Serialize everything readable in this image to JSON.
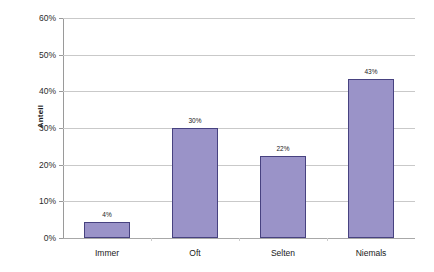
{
  "chart_data": {
    "type": "bar",
    "title": "",
    "subtitle": "",
    "xlabel": "",
    "ylabel": "Anteil",
    "categories": [
      "Immer",
      "Oft",
      "Selten",
      "Niemals"
    ],
    "values": [
      4.4,
      30.0,
      22.4,
      43.3
    ],
    "data_labels": [
      "4%",
      "30%",
      "22%",
      "43%"
    ],
    "ylim": [
      0,
      60
    ],
    "ytick_values": [
      0,
      10,
      20,
      30,
      40,
      50,
      60
    ],
    "ytick_labels": [
      "0%",
      "10%",
      "20%",
      "30%",
      "40%",
      "50%",
      "60%"
    ],
    "grid": "horizontal",
    "legend": "none",
    "series": [
      {
        "name": "Anteil",
        "values": [
          4.4,
          30.0,
          22.4,
          43.3
        ],
        "bar_fill_color": "#9a93c8",
        "bar_border_color": "#474280"
      }
    ]
  },
  "style": {
    "background_color": "#ffffff",
    "gridline_color": "#c9c9c9",
    "axis_color": "#9a9a9a",
    "text_color": "#1a1a1a"
  }
}
